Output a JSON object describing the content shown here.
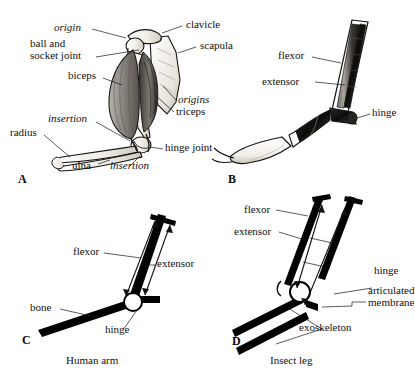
{
  "figure": {
    "panels": [
      {
        "id": "A",
        "letter": "A",
        "subject": "human-arm-anatomy",
        "labels": [
          {
            "key": "origin",
            "text": "origin",
            "style": "italic"
          },
          {
            "key": "clavicle",
            "text": "clavicle",
            "style": "roman"
          },
          {
            "key": "ball_and_socket_joint",
            "text": "ball and\nsocket joint",
            "style": "roman"
          },
          {
            "key": "scapula",
            "text": "scapula",
            "style": "roman"
          },
          {
            "key": "biceps",
            "text": "biceps",
            "style": "roman"
          },
          {
            "key": "origins",
            "text": "origins",
            "style": "italic"
          },
          {
            "key": "triceps",
            "text": "triceps",
            "style": "roman"
          },
          {
            "key": "insertion_upper",
            "text": "insertion",
            "style": "italic"
          },
          {
            "key": "radius",
            "text": "radius",
            "style": "roman"
          },
          {
            "key": "hinge_joint",
            "text": "hinge joint",
            "style": "roman"
          },
          {
            "key": "ulna",
            "text": "ulna",
            "style": "roman"
          },
          {
            "key": "insertion_lower",
            "text": "insertion",
            "style": "italic"
          }
        ]
      },
      {
        "id": "B",
        "letter": "B",
        "subject": "insect-leg-anatomy",
        "labels": [
          {
            "key": "flexor",
            "text": "flexor",
            "style": "roman"
          },
          {
            "key": "extensor",
            "text": "extensor",
            "style": "roman"
          },
          {
            "key": "hinge",
            "text": "hinge",
            "style": "roman"
          }
        ]
      },
      {
        "id": "C",
        "letter": "C",
        "subject": "human-arm-schematic",
        "caption": "Human arm",
        "labels": [
          {
            "key": "flexor",
            "text": "flexor",
            "style": "roman"
          },
          {
            "key": "extensor",
            "text": "extensor",
            "style": "roman"
          },
          {
            "key": "bone",
            "text": "bone",
            "style": "roman"
          },
          {
            "key": "hinge",
            "text": "hinge",
            "style": "roman"
          }
        ]
      },
      {
        "id": "D",
        "letter": "D",
        "subject": "insect-leg-schematic",
        "caption": "Insect leg",
        "labels": [
          {
            "key": "flexor",
            "text": "flexor",
            "style": "roman"
          },
          {
            "key": "extensor",
            "text": "extensor",
            "style": "roman"
          },
          {
            "key": "hinge",
            "text": "hinge",
            "style": "roman"
          },
          {
            "key": "articulated_membrane",
            "text": "articulated\nmembrane",
            "style": "roman"
          },
          {
            "key": "exoskeleton",
            "text": "exoskeleton",
            "style": "roman"
          }
        ]
      }
    ],
    "colors": {
      "ink": "#101010",
      "bone_fill": "#f2efe9",
      "muscle_fill": "#9a958f",
      "muscle_dark": "#4a4742",
      "background": "#ffffff",
      "schematic_bar": "#000000",
      "hinge_fill": "#ffffff"
    }
  }
}
